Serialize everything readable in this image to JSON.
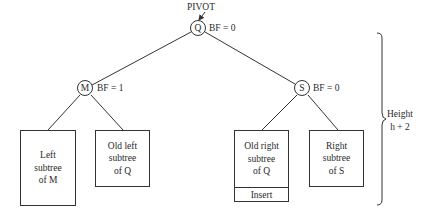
{
  "diagram": {
    "pivot_label": "PIVOT",
    "nodes": {
      "root": {
        "label": "Q",
        "bf": "BF = 0"
      },
      "left": {
        "label": "M",
        "bf": "BF = 1"
      },
      "right": {
        "label": "S",
        "bf": "BF = 0"
      }
    },
    "subtrees": [
      {
        "lines": [
          "Left",
          "subtree",
          "of M"
        ]
      },
      {
        "lines": [
          "Old left",
          "subtree",
          "of Q"
        ]
      },
      {
        "lines": [
          "Old right",
          "subtree",
          "of Q"
        ],
        "footer": "Insert"
      },
      {
        "lines": [
          "Right",
          "subtree",
          "of S"
        ]
      }
    ],
    "height_annotation": {
      "line1": "Height",
      "line2": "h + 2"
    }
  }
}
